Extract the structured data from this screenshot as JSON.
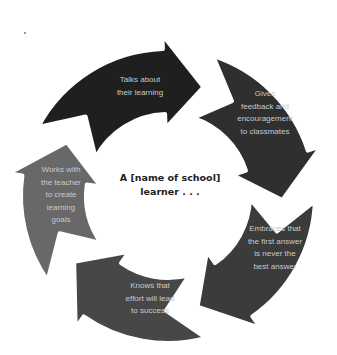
{
  "diagram": {
    "type": "cycle",
    "center_label": "A [name of school]\nlearner . . .",
    "background": "#ffffff",
    "gap_color": "#ffffff",
    "geometry": {
      "cx": 168,
      "cy": 196,
      "r_inner": 82,
      "r_outer": 147
    },
    "segments": [
      {
        "label": "Talks about\ntheir learning",
        "color": "#1f1f1f",
        "start_deg": -62,
        "tip_deg": 18,
        "text_x": 100,
        "text_y": 74,
        "text_w": 80
      },
      {
        "label": "Gives\nfeedback and\nencouragement\nto classmates",
        "color": "#2f2f2f",
        "start_deg": 18,
        "tip_deg": 92,
        "text_x": 220,
        "text_y": 88,
        "text_w": 90
      },
      {
        "label": "Embraces that\nthe first answer\nis never the\nbest answer",
        "color": "#3b3b3b",
        "start_deg": 92,
        "tip_deg": 165,
        "text_x": 230,
        "text_y": 223,
        "text_w": 90
      },
      {
        "label": "Knows that\neffort will lead\nto success",
        "color": "#474747",
        "start_deg": 165,
        "tip_deg": 235,
        "text_x": 110,
        "text_y": 280,
        "text_w": 80
      },
      {
        "label": "Works with\nthe teacher\nto create\nlearning\ngoals",
        "color": "#686868",
        "start_deg": 235,
        "tip_deg": 298,
        "text_x": 30,
        "text_y": 164,
        "text_w": 62
      }
    ]
  }
}
